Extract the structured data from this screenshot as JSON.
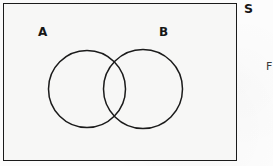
{
  "diagram": {
    "type": "venn",
    "universal_set": {
      "label": "S",
      "shape": "rectangle",
      "x": 3,
      "y": 3,
      "width": 234,
      "height": 158,
      "stroke_color": "#1b1b1b",
      "fill_color": "#f7f7f6"
    },
    "sets": [
      {
        "label": "A",
        "shape": "circle",
        "cx": 87,
        "cy": 89,
        "r": 38.5,
        "label_x": 38,
        "label_y": 26,
        "stroke_color": "#1b1b1b",
        "fill_color": "none"
      },
      {
        "label": "B",
        "shape": "circle",
        "cx": 143,
        "cy": 89,
        "r": 39.5,
        "label_x": 159,
        "label_y": 26,
        "stroke_color": "#1b1b1b",
        "fill_color": "none"
      }
    ],
    "regions": {
      "intersection_shaded": false,
      "shaded_color": "none"
    },
    "edge_text": "F",
    "background_color": "#fcfcfc"
  }
}
